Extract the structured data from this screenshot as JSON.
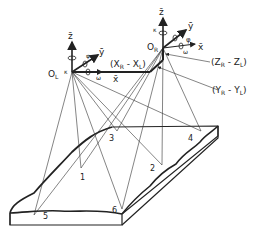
{
  "diagram": {
    "title": "",
    "left_station": {
      "origin_label": "O",
      "origin_sub": "L",
      "axes": {
        "z": "z̄",
        "y": "ȳ",
        "x": "x̄"
      },
      "rotations": {
        "kappa": "κ",
        "phi": "φ",
        "omega": "ω"
      }
    },
    "right_station": {
      "origin_label": "O",
      "origin_sub": "R",
      "axes": {
        "z": "z̄",
        "y": "ȳ",
        "x": "x̄"
      },
      "rotations": {
        "kappa": "κ",
        "phi": "φ",
        "omega": "ω"
      }
    },
    "baseline_labels": {
      "x": "(X",
      "x_sub1": "R",
      "x_mid": " - X",
      "x_sub2": "L",
      "x_end": ")",
      "z": "(Z",
      "z_sub1": "R",
      "z_mid": " - Z",
      "z_sub2": "L",
      "z_end": ")",
      "y": "(Y",
      "y_sub1": "R",
      "y_mid": " - Y",
      "y_sub2": "L",
      "y_end": ")"
    },
    "ground_points": [
      "1",
      "2",
      "3",
      "4",
      "5",
      "6"
    ],
    "colors": {
      "ink": "#222222",
      "background": "#ffffff"
    }
  }
}
